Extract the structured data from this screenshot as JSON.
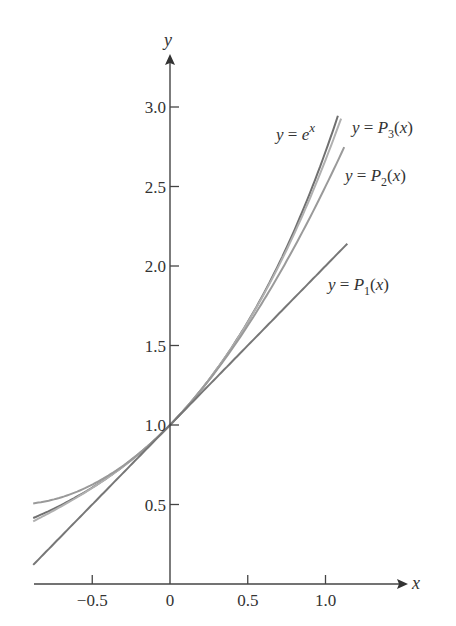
{
  "chart_data": {
    "type": "line",
    "title": "",
    "xlabel": "x",
    "ylabel": "y",
    "xlim": [
      -0.88,
      1.4
    ],
    "ylim": [
      0,
      3.45
    ],
    "grid": false,
    "x_ticks": [
      -0.5,
      0,
      0.5,
      1.0
    ],
    "x_tick_labels": [
      "−0.5",
      "0",
      "0.5",
      "1.0"
    ],
    "y_ticks": [
      0.5,
      1.0,
      1.5,
      2.0,
      2.5,
      3.0
    ],
    "y_tick_labels": [
      "0.5",
      "1.0",
      "1.5",
      "2.0",
      "2.5",
      "3.0"
    ],
    "legend_position": "inline labels at curve ends",
    "series": [
      {
        "name": "y = e^x",
        "function": "exp(x)",
        "x_range": [
          -0.88,
          1.08
        ],
        "color": "#707070",
        "label": {
          "prefix": "y = e",
          "sup": "x"
        }
      },
      {
        "name": "y = P3(x)",
        "function": "1 + x + x^2/2 + x^3/6",
        "x_range": [
          -0.88,
          1.1
        ],
        "color": "#b0b0b0",
        "label": {
          "prefix": "y = P",
          "sub": "3",
          "suffix": "(x)"
        }
      },
      {
        "name": "y = P2(x)",
        "function": "1 + x + x^2/2",
        "x_range": [
          -0.88,
          1.12
        ],
        "color": "#9a9a9a",
        "label": {
          "prefix": "y = P",
          "sub": "2",
          "suffix": "(x)"
        }
      },
      {
        "name": "y = P1(x)",
        "function": "1 + x",
        "x_range": [
          -0.88,
          1.14
        ],
        "color": "#777777",
        "label": {
          "prefix": "y = P",
          "sub": "1",
          "suffix": "(x)"
        }
      }
    ],
    "sample_points": {
      "x": [
        -0.8,
        -0.5,
        0,
        0.5,
        1.0
      ],
      "exp": [
        0.449,
        0.607,
        1.0,
        1.649,
        2.718
      ],
      "P3": [
        0.435,
        0.604,
        1.0,
        1.646,
        2.667
      ],
      "P2": [
        0.52,
        0.625,
        1.0,
        1.625,
        2.5
      ],
      "P1": [
        0.2,
        0.5,
        1.0,
        1.5,
        2.0
      ]
    }
  }
}
